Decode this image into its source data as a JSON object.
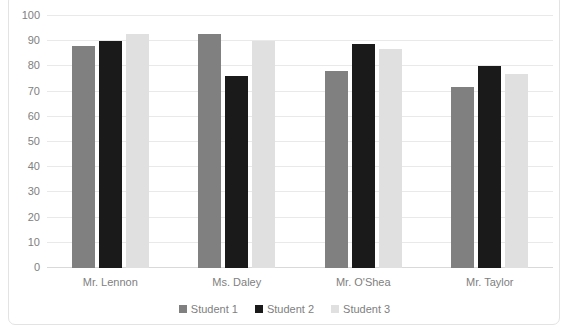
{
  "chart_data": {
    "type": "bar",
    "title": "",
    "xlabel": "",
    "ylabel": "",
    "ylim": [
      0,
      100
    ],
    "ytick_step": 10,
    "yticks": [
      100,
      90,
      80,
      70,
      60,
      50,
      40,
      30,
      20,
      10,
      0
    ],
    "grid": true,
    "legend_position": "bottom",
    "categories": [
      "Mr. Lennon",
      "Ms. Daley",
      "Mr. O'Shea",
      "Mr. Taylor"
    ],
    "series": [
      {
        "name": "Student 1",
        "color": "#808080",
        "values": [
          88,
          93,
          78,
          72
        ]
      },
      {
        "name": "Student 2",
        "color": "#1a1a1a",
        "values": [
          90,
          76,
          89,
          80
        ]
      },
      {
        "name": "Student 3",
        "color": "#e0e0e0",
        "values": [
          93,
          90,
          87,
          77
        ]
      }
    ]
  },
  "legend": {
    "items": [
      {
        "label": "Student 1",
        "color": "#808080"
      },
      {
        "label": "Student 2",
        "color": "#1a1a1a"
      },
      {
        "label": "Student 3",
        "color": "#e0e0e0"
      }
    ]
  },
  "axes": {
    "y": {
      "ticks": [
        "100",
        "90",
        "80",
        "70",
        "60",
        "50",
        "40",
        "30",
        "20",
        "10",
        "0"
      ]
    },
    "x": {
      "ticks": [
        "Mr. Lennon",
        "Ms. Daley",
        "Mr. O'Shea",
        "Mr. Taylor"
      ]
    }
  },
  "colors": {
    "gridline": "#e9e9e9",
    "baseline": "#d9d9d9",
    "frame": "#e3e3e3",
    "tick_text": "#808080",
    "background": "#ffffff"
  }
}
